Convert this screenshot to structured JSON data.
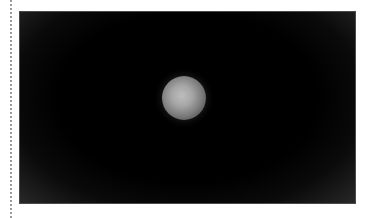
{
  "image": {
    "description": "Dark photograph with a single softly lit grey sphere near the center",
    "subject": "sphere",
    "background_color": "#000000",
    "subject_color": "#b0b0b0",
    "vignette_color": "#2a2a2a"
  },
  "page": {
    "background_color": "#ffffff",
    "left_rule": "dotted"
  }
}
